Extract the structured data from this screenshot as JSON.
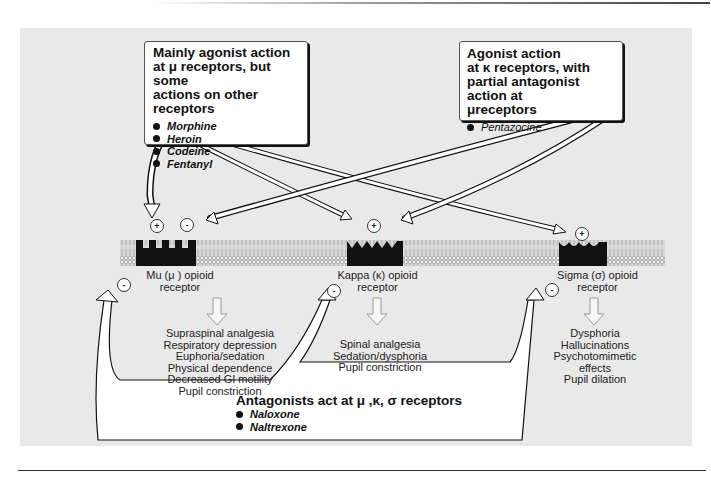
{
  "figure": {
    "agonist_box_mu": {
      "title_lines": [
        "Mainly agonist action",
        "at μ receptors, but some",
        "actions on other receptors"
      ],
      "drugs": [
        "Morphine",
        "Heroin",
        "Codeine",
        "Fentanyl"
      ]
    },
    "agonist_box_kappa": {
      "title_lines": [
        "Agonist action",
        "at κ receptors, with",
        "partial antagonist action at",
        "μreceptors"
      ],
      "drugs": [
        "Pentazocine"
      ]
    },
    "antagonist_box": {
      "title": "Antagonists act at μ ,κ, σ receptors",
      "drugs": [
        "Naloxone",
        "Naltrexone"
      ]
    },
    "receptors": [
      {
        "label_lines": [
          "Mu (μ ) opioid",
          "receptor"
        ],
        "effects": [
          "Supraspinal analgesia",
          "Respiratory depression",
          "Euphoria/sedation",
          "Physical dependence",
          "Decreased GI motility",
          "Pupil constriction"
        ]
      },
      {
        "label_lines": [
          "Kappa (κ) opioid",
          "receptor"
        ],
        "effects": [
          "Spinal analgesia",
          "Sedation/dysphoria",
          "Pupil constriction"
        ]
      },
      {
        "label_lines": [
          "Sigma (σ) opioid",
          "receptor"
        ],
        "effects": [
          "Dysphoria",
          "Hallucinations",
          "Psychotomimetic",
          "effects",
          "Pupil dilation"
        ]
      }
    ],
    "signs": {
      "plus": "+",
      "minus": "-"
    },
    "colors": {
      "panel_bg": "#e9e9e9",
      "receptor_fill": "#111111",
      "membrane": "#bdbdbd",
      "arrow_fill": "#ffffff",
      "arrow_edge": "#111111"
    }
  }
}
